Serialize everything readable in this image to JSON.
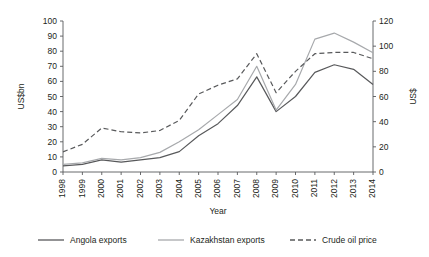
{
  "chart_data": {
    "type": "line",
    "title": "",
    "xlabel": "Year",
    "ylabel": "US$bn",
    "y2label": "US$",
    "grid": false,
    "legend_position": "bottom",
    "categories": [
      "1998",
      "1999",
      "2000",
      "2001",
      "2002",
      "2003",
      "2004",
      "2005",
      "2006",
      "2007",
      "2008",
      "2009",
      "2010",
      "2011",
      "2012",
      "2013",
      "2014"
    ],
    "ylim": [
      0,
      100
    ],
    "yticks": [
      0,
      10,
      20,
      30,
      40,
      50,
      60,
      70,
      80,
      90,
      100
    ],
    "y2lim": [
      0,
      120
    ],
    "y2ticks": [
      0,
      20,
      40,
      60,
      80,
      100,
      120
    ],
    "series": [
      {
        "name": "Angola exports",
        "axis": "left",
        "style": "solid",
        "color": "#58595b",
        "values": [
          4,
          5,
          8,
          6.5,
          8,
          9.5,
          13.5,
          24,
          32,
          44,
          63,
          40,
          50,
          66,
          71,
          68,
          58
        ]
      },
      {
        "name": "Kazakhstan exports",
        "axis": "left",
        "style": "solid",
        "color": "#a7a9ac",
        "values": [
          5,
          6,
          9,
          8,
          9.5,
          13,
          20,
          28,
          38,
          48,
          70,
          41,
          58,
          88,
          92,
          86,
          79
        ]
      },
      {
        "name": "Crude oil price",
        "axis": "right",
        "style": "dashed",
        "color": "#58595b",
        "values": [
          16,
          22,
          35,
          32,
          31,
          33,
          41,
          62,
          69,
          74,
          94,
          63,
          80,
          94,
          95,
          95,
          90
        ]
      }
    ]
  },
  "legend": {
    "items": [
      {
        "label": "Angola exports",
        "swatch": "solid-dark"
      },
      {
        "label": "Kazakhstan exports",
        "swatch": "solid-light"
      },
      {
        "label": "Crude oil price",
        "swatch": "dashed-dark"
      }
    ]
  },
  "axis_titles": {
    "left": "US$bn",
    "right": "US$",
    "bottom": "Year"
  }
}
